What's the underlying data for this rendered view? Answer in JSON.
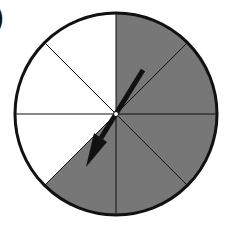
{
  "figure": {
    "label": ")",
    "spinner": {
      "sectors": 8,
      "shaded_sectors": 5,
      "unshaded_sectors": 3,
      "shade_color": "#777777",
      "unshaded_color": "#ffffff",
      "outline_color": "#111111",
      "arrow": {
        "pointing": "lower-left",
        "color": "#111111"
      }
    }
  }
}
